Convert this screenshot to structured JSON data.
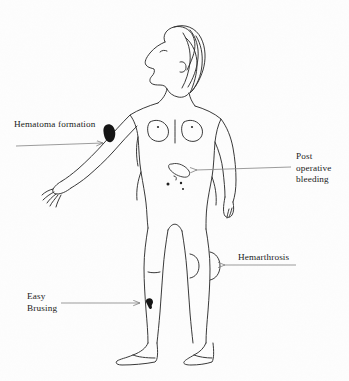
{
  "figure": {
    "background_color": "#fdfdfd",
    "ink_color": "#2a2a2a",
    "arrow_color": "#7a7a7a",
    "lesion_fill": "#1a1a1a"
  },
  "labels": {
    "hematoma": {
      "text": "Hematoma formation",
      "arrow_direction": "right",
      "points_to": "right forearm"
    },
    "post_operative": {
      "text": "Post\noperative\nbleeding",
      "arrow_direction": "left",
      "points_to": "abdominal surgical wound"
    },
    "hemarthrosis": {
      "text": "Hemarthrosis",
      "arrow_direction": "left",
      "points_to": "left knee joint"
    },
    "easy_bruising": {
      "text": "Easy\nBrusing",
      "arrow_direction": "right",
      "points_to": "right shin"
    }
  },
  "markers": [
    {
      "name": "hematoma-blob",
      "type": "filled-blob",
      "location": "right forearm"
    },
    {
      "name": "surgical-wound",
      "type": "open-ellipse",
      "location": "left lower abdomen"
    },
    {
      "name": "petechiae-dots",
      "type": "dots",
      "count": 3,
      "location": "lower abdomen"
    },
    {
      "name": "knee-effusion",
      "type": "oval-bulge",
      "location": "left knee"
    },
    {
      "name": "shin-bruise",
      "type": "filled-blob",
      "location": "right shin"
    }
  ]
}
